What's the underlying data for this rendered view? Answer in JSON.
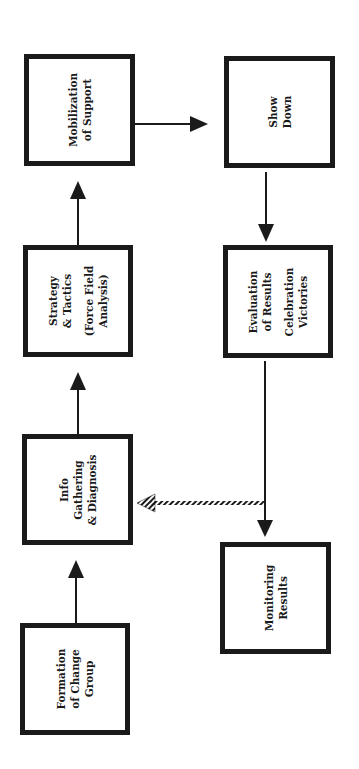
{
  "diagram": {
    "orientation": "rotated-90-ccw",
    "colors": {
      "stroke": "#1a1a1a",
      "background": "#ffffff"
    },
    "nodes": [
      {
        "id": "formation",
        "lines": [
          "Formation",
          "of Change",
          "Group"
        ]
      },
      {
        "id": "info",
        "lines": [
          "Info",
          "Gathering",
          "& Diagnosis"
        ]
      },
      {
        "id": "strategy",
        "lines": [
          "Strategy",
          "& Tactics",
          "",
          "(Force Field",
          "Analysis)"
        ]
      },
      {
        "id": "mobilization",
        "lines": [
          "Mobilization",
          "of Support"
        ]
      },
      {
        "id": "showdown",
        "lines": [
          "Show",
          "Down"
        ]
      },
      {
        "id": "evaluation",
        "lines": [
          "Evaluation",
          "of Results",
          "",
          "Celebration",
          "Victories"
        ]
      },
      {
        "id": "monitoring",
        "lines": [
          "Monitoring",
          "Results"
        ]
      }
    ],
    "edges": [
      {
        "from": "formation",
        "to": "info",
        "style": "solid"
      },
      {
        "from": "info",
        "to": "strategy",
        "style": "solid"
      },
      {
        "from": "strategy",
        "to": "mobilization",
        "style": "solid"
      },
      {
        "from": "mobilization",
        "to": "showdown",
        "style": "solid"
      },
      {
        "from": "showdown",
        "to": "evaluation",
        "style": "solid"
      },
      {
        "from": "evaluation",
        "to": "monitoring",
        "style": "solid"
      },
      {
        "from": "evaluation",
        "to": "info",
        "style": "hatched-feedback"
      }
    ]
  }
}
